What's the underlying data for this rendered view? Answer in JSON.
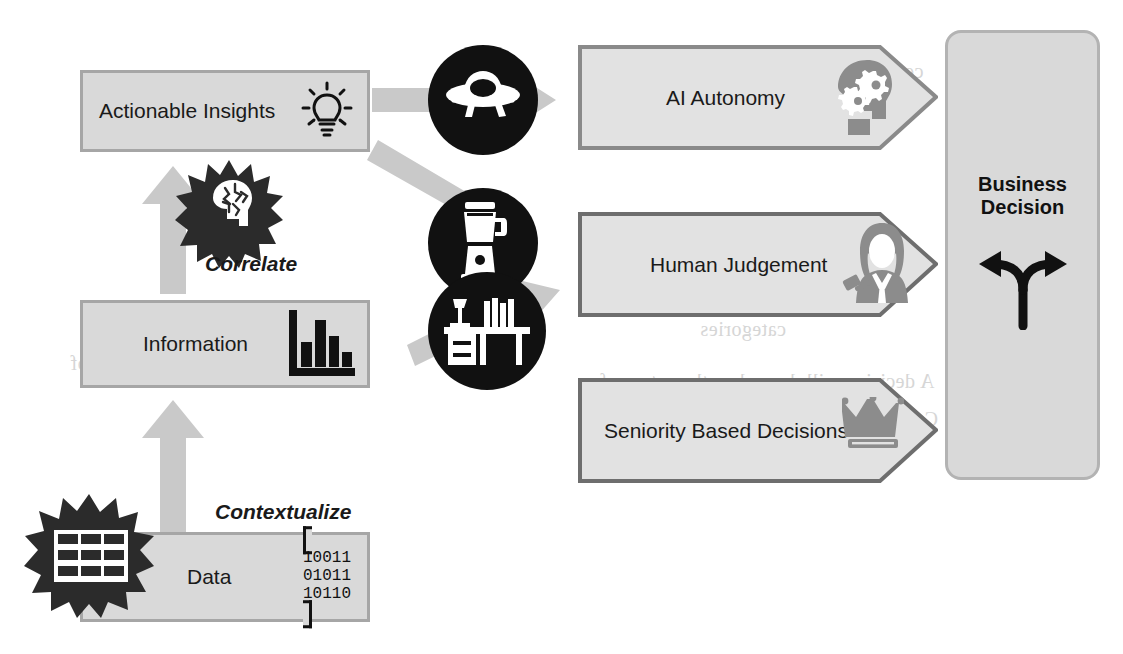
{
  "diagram": {
    "colors": {
      "box_fill": "#d9d9d9",
      "box_border": "#a6a6a6",
      "arrow_grey": "#c9c9c9",
      "icon_black": "#111111",
      "icon_grey": "#8c8c8c",
      "text": "#1a1a1a"
    },
    "left_stack": [
      {
        "label": "Actionable Insights",
        "icon": "lightbulb-icon"
      },
      {
        "label": "Information",
        "icon": "bar-chart-icon"
      },
      {
        "label": "Data",
        "icon": "binary-code-icon"
      }
    ],
    "data_binary": [
      "10011",
      "01011",
      "10110"
    ],
    "process_steps": [
      {
        "label": "Correlate",
        "icon": "head-with-network-burst-icon"
      },
      {
        "label": "Contextualize",
        "icon": "spreadsheet-grid-burst-icon"
      }
    ],
    "mediators": [
      {
        "icon": "ufo-icon",
        "alt": "flying saucer"
      },
      {
        "icon": "blender-icon",
        "alt": "kitchen blender"
      },
      {
        "icon": "desk-lamp-books-icon",
        "alt": "desk with lamp and books"
      }
    ],
    "outcomes": [
      {
        "label": "AI Autonomy",
        "icon": "head-with-gears-icon"
      },
      {
        "label": "Human Judgement",
        "icon": "judge-gavel-icon"
      },
      {
        "label": "Seniority Based Decisions",
        "icon": "crown-icon"
      }
    ],
    "decision": {
      "line1": "Business",
      "line2": "Decision",
      "icon": "forked-arrows-icon"
    },
    "bleed_through": [
      "ceed when there are two conflicting",
      "business interests (i.e. actually in",
      "as in which you must attempt to",
      "indicate a conflict of",
      "categories",
      "A decision will depend on the nature of",
      "CoO and the assertion mentioned above"
    ]
  }
}
